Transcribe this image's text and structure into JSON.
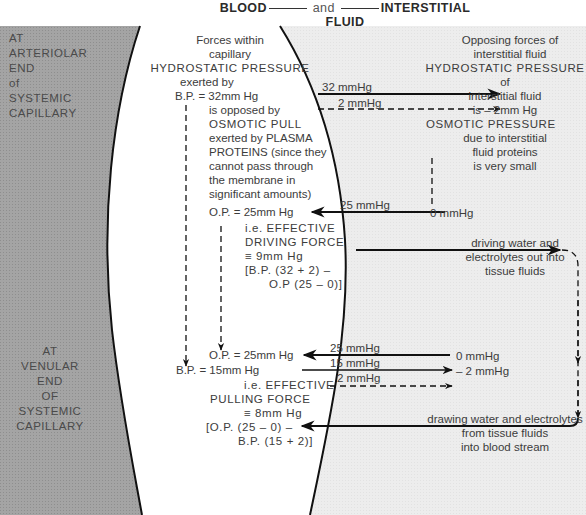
{
  "header": {
    "left": "BLOOD",
    "connector": "and",
    "right": "INTERSTITIAL FLUID"
  },
  "left_panel": {
    "arteriolar": [
      "AT",
      "ARTERIOLAR",
      "END",
      "of",
      "SYSTEMIC",
      "CAPILLARY"
    ],
    "venular": [
      "AT",
      "VENULAR",
      "END",
      "OF",
      "SYSTEMIC",
      "CAPILLARY"
    ]
  },
  "capillary": {
    "title1": "Forces within",
    "title2": "capillary",
    "hp_title": "HYDROSTATIC  PRESSURE",
    "exerted_by": "exerted by",
    "bp_arterial": "B.P. = 32mm Hg",
    "opposed_lines": [
      "is opposed by",
      "OSMOTIC  PULL",
      "exerted by  PLASMA",
      "PROTEINS  (since they",
      "cannot pass through",
      "the membrane in",
      "significant amounts)"
    ],
    "op_arterial": "O.P. = 25mm Hg",
    "driving_lines": [
      "i.e.  EFFECTIVE",
      "DRIVING  FORCE",
      "≡  9mm Hg",
      "[B.P. (32 + 2) –",
      "O.P  (25 – 0)]"
    ],
    "op_venular": "O.P. = 25mm Hg",
    "bp_venular": "B.P. = 15mm Hg",
    "pulling_lines": [
      "i.e.  EFFECTIVE",
      "PULLING  FORCE",
      "≡  8mm Hg",
      "[O.P. (25 – 0) –",
      "B.P. (15 + 2)]"
    ]
  },
  "interstitial": {
    "title1": "Opposing forces of",
    "title2": "interstitial fluid",
    "hp_title": "HYDROSTATIC  PRESSURE",
    "of": "of",
    "if_line": "interstitial fluid",
    "is_value": "is – 2mm Hg",
    "op_title": "OSMOTIC  PRESSURE",
    "op_lines": [
      "due to interstitial",
      "fluid proteins",
      "is very small"
    ],
    "zero_arterial": "0 mmHg",
    "zero_venular": "0 mmHg",
    "neg2_venular": "– 2 mmHg",
    "driving_out": [
      "driving water and",
      "electrolytes out into",
      "tissue fluids"
    ],
    "drawing_in": [
      "drawing water and electrolytes",
      "from tissue fluids",
      "into blood stream"
    ]
  },
  "arrow_labels": {
    "a32": "32 mmHg",
    "a2": "2 mmHg",
    "a25": "25 mmHg",
    "v25": "25 mmHg",
    "v15": "15 mmHg",
    "v2": "2 mmHg"
  },
  "colors": {
    "blood_shade": "#a9a9a9",
    "interstitial_shade": "#ececec",
    "capillary": "#ffffff",
    "line": "#111111",
    "text": "#3c3c3c"
  }
}
